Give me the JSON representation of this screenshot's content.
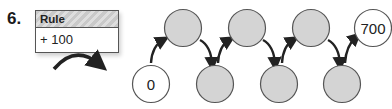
{
  "problem": {
    "number": "6.",
    "rule": {
      "header": "Rule",
      "value": "+ 100"
    }
  },
  "number_chain": {
    "start_value": "0",
    "end_value": "700",
    "blank_fill_color": "#d4d4d4",
    "top_row": [
      {
        "label": "",
        "filled": true
      },
      {
        "label": "",
        "filled": true
      },
      {
        "label": "",
        "filled": true
      },
      {
        "label": "700",
        "filled": false
      }
    ],
    "bottom_row": [
      {
        "label": "0",
        "filled": false
      },
      {
        "label": "",
        "filled": true
      },
      {
        "label": "",
        "filled": true
      },
      {
        "label": "",
        "filled": true
      }
    ]
  }
}
